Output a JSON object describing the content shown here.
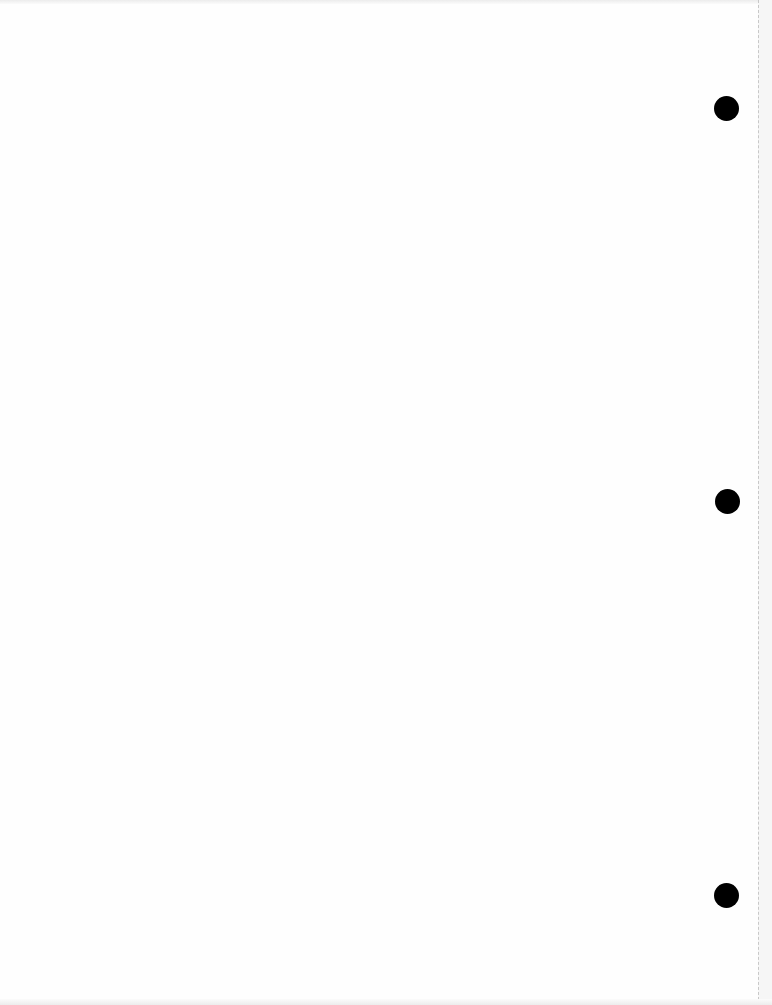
{
  "document": {
    "type": "blank scanned page",
    "content_text": "",
    "hole_punches": [
      {
        "cx": 726,
        "cy": 108
      },
      {
        "cx": 727,
        "cy": 501
      },
      {
        "cx": 726,
        "cy": 895
      }
    ]
  }
}
